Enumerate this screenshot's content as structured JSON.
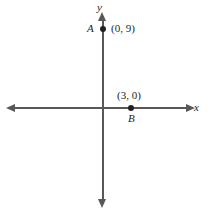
{
  "figure": {
    "type": "coordinate-plane-diagram",
    "width": 211,
    "height": 215,
    "background_color": "#ffffff"
  },
  "axes": {
    "x": {
      "label": "x",
      "arrow_left": "◀",
      "arrow_right": "▶",
      "color": "#58585a"
    },
    "y": {
      "label": "y",
      "arrow_up": "▲",
      "arrow_down": "▼",
      "color": "#58585a"
    },
    "origin_px": [
      103,
      108
    ]
  },
  "points": [
    {
      "letter": "A",
      "coords_label": "(0, 9)",
      "x": 0,
      "y": 9,
      "dot_color": "#231f20",
      "letter_side": "left",
      "coords_side": "right"
    },
    {
      "letter": "B",
      "coords_label": "(3, 0)",
      "x": 3,
      "y": 0,
      "dot_color": "#231f20",
      "letter_side": "below",
      "coords_side": "above"
    }
  ],
  "chart_data": {
    "type": "scatter",
    "title": "",
    "xlabel": "x",
    "ylabel": "y",
    "grid": false,
    "legend": "none",
    "xlim": [
      -11,
      11
    ],
    "ylim": [
      -11,
      11
    ],
    "series": [
      {
        "name": "plotted-points",
        "points": [
          {
            "label": "A",
            "x": 0,
            "y": 9,
            "annotation": "(0, 9)"
          },
          {
            "label": "B",
            "x": 3,
            "y": 0,
            "annotation": "(3, 0)"
          }
        ]
      }
    ],
    "xticks": [],
    "yticks": [],
    "annotations": [
      "A",
      "(0, 9)",
      "(3, 0)",
      "B",
      "x",
      "y"
    ]
  }
}
